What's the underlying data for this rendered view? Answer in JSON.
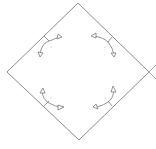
{
  "diagram": {
    "shape": "diamond",
    "stroke_color": "#6e6e6e",
    "arrow_color": "#7a7a7a",
    "vertices": {
      "top": [
        78,
        3
      ],
      "right": [
        149,
        72
      ],
      "bottom": [
        79,
        140
      ],
      "left": [
        7,
        72
      ]
    },
    "arrows": [
      {
        "position": "upper-left",
        "direction": "curved-double"
      },
      {
        "position": "upper-right",
        "direction": "curved-double"
      },
      {
        "position": "lower-left",
        "direction": "curved-double"
      },
      {
        "position": "lower-right",
        "direction": "curved-double"
      }
    ]
  }
}
